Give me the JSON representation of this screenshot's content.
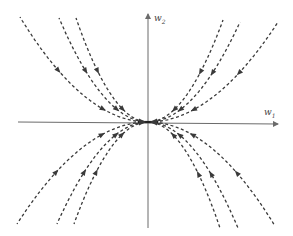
{
  "diagram": {
    "type": "phase-portrait",
    "axes": {
      "x_label": "w",
      "x_sub": "1",
      "y_label": "w",
      "y_sub": "2",
      "origin_px": [
        148,
        122
      ]
    },
    "trajectories": [
      {
        "id": "ul-1",
        "quadrant": "upper-left",
        "end": [
          20,
          17
        ]
      },
      {
        "id": "ul-2",
        "quadrant": "upper-left",
        "end": [
          59,
          18
        ]
      },
      {
        "id": "ul-3",
        "quadrant": "upper-left",
        "end": [
          76,
          18
        ]
      },
      {
        "id": "ur-1",
        "quadrant": "upper-right",
        "end": [
          223,
          20
        ]
      },
      {
        "id": "ur-2",
        "quadrant": "upper-right",
        "end": [
          240,
          22
        ]
      },
      {
        "id": "ur-3",
        "quadrant": "upper-right",
        "end": [
          278,
          22
        ]
      },
      {
        "id": "ll-1",
        "quadrant": "lower-left",
        "end": [
          17,
          224
        ]
      },
      {
        "id": "ll-2",
        "quadrant": "lower-left",
        "end": [
          57,
          224
        ]
      },
      {
        "id": "ll-3",
        "quadrant": "lower-left",
        "end": [
          74,
          224
        ]
      },
      {
        "id": "lr-1",
        "quadrant": "lower-right",
        "end": [
          220,
          228
        ]
      },
      {
        "id": "lr-2",
        "quadrant": "lower-right",
        "end": [
          238,
          228
        ]
      },
      {
        "id": "lr-3",
        "quadrant": "lower-right",
        "end": [
          275,
          226
        ]
      }
    ],
    "flow_direction": "toward origin",
    "colors": {
      "axis": "#6b6b6b",
      "trajectory": "#3a3a3a",
      "background": "#ffffff"
    }
  }
}
